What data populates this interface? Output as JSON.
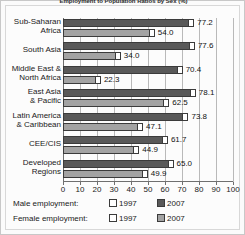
{
  "chart_data": {
    "type": "bar",
    "orientation": "horizontal",
    "title": "Employment to Population Ratios by Sex (%)",
    "xlabel": "",
    "ylabel": "",
    "xlim": [
      0,
      100
    ],
    "grid": true,
    "legend_position": "bottom",
    "categories": [
      "Sub-Saharan Africa",
      "South Asia",
      "Middle East & North Africa",
      "East Asia & Pacific",
      "Latin America & Caribbean",
      "CEE/CIS",
      "Developed Regions"
    ],
    "category_lines": [
      [
        "Sub-Saharan",
        "Africa"
      ],
      [
        "South Asia",
        ""
      ],
      [
        "Middle East &",
        "North Africa"
      ],
      [
        "East Asia",
        "& Pacific"
      ],
      [
        "Latin America",
        "& Caribbean"
      ],
      [
        "CEE/CIS",
        ""
      ],
      [
        "Developed",
        "Regions"
      ]
    ],
    "xticks": [
      0,
      10,
      20,
      30,
      40,
      50,
      60,
      70,
      80,
      90,
      100
    ],
    "xticklabels": [
      "0",
      "10",
      "20",
      "30",
      "40",
      "50",
      "60",
      "70",
      "80",
      "90",
      "100"
    ],
    "series": [
      {
        "name": "Male employment 2007",
        "sex": "Male",
        "year": "2007",
        "color": "#595959",
        "values": [
          77.2,
          77.6,
          70.4,
          78.1,
          73.8,
          61.7,
          65.0
        ],
        "labels": [
          "77.2",
          "77.6",
          "70.4",
          "78.1",
          "73.8",
          "61.7",
          "65.0"
        ]
      },
      {
        "name": "Female employment 2007",
        "sex": "Female",
        "year": "2007",
        "color": "#a3a3a3",
        "values": [
          54.0,
          34.0,
          22.3,
          62.5,
          47.1,
          44.9,
          49.9
        ],
        "labels": [
          "54.0",
          "34.0",
          "22.3",
          "62.5",
          "47.1",
          "44.9",
          "49.9"
        ]
      }
    ]
  },
  "legend": {
    "rows": [
      {
        "caption": "Male employment:",
        "items": [
          {
            "label": "1997",
            "style": "open"
          },
          {
            "label": "2007",
            "style": "male2007"
          }
        ]
      },
      {
        "caption": "Female employment:",
        "items": [
          {
            "label": "1997",
            "style": "open"
          },
          {
            "label": "2007",
            "style": "female2007"
          }
        ]
      }
    ]
  },
  "colors": {
    "male_2007": "#595959",
    "female_2007": "#a3a3a3",
    "marker_1997": "#ffffff",
    "axis": "#6f6f6f",
    "grid": "#b9b9b9",
    "frame": "#c8c8c8"
  }
}
